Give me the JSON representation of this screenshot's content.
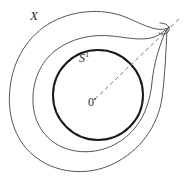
{
  "figure": {
    "background_color": "#ffffff",
    "width": 184,
    "height": 179,
    "labels": {
      "spiral": "X",
      "circle": "S",
      "circle_superscript": "1",
      "origin": "0"
    },
    "colors": {
      "circle_stroke": "#1a1a1a",
      "spiral_stroke": "#555555",
      "dashed_stroke": "#777777",
      "label_text": "#2b2b2b"
    },
    "geometry": {
      "center": {
        "x": 98,
        "y": 95
      },
      "circle_radius": 45,
      "circle_stroke_width": 2.0,
      "spiral_stroke_width": 1.0,
      "dashed_ray": {
        "from": {
          "x": 95,
          "y": 99
        },
        "to": {
          "x": 181,
          "y": 17
        },
        "dash_pattern": "4 3"
      },
      "cusp_point": {
        "x": 167,
        "y": 28
      }
    }
  }
}
